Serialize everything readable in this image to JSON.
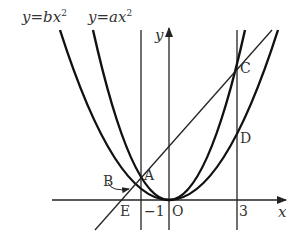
{
  "diagram": {
    "type": "coordinate-geometry",
    "equations": {
      "outer": "y=bx²",
      "inner": "y=ax²"
    },
    "axis_labels": {
      "x": "x",
      "y": "y"
    },
    "origin_label": "O",
    "tick_labels": {
      "neg_one": "−1",
      "three": "3"
    },
    "points": {
      "A": "A",
      "B": "B",
      "C": "C",
      "D": "D",
      "E": "E"
    },
    "colors": {
      "stroke": "#222222",
      "text": "#333333",
      "background": "#ffffff"
    }
  }
}
